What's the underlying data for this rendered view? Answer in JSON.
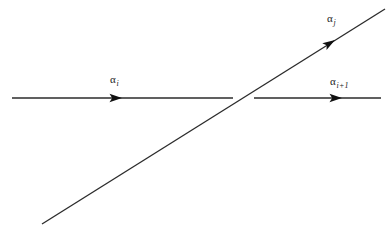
{
  "figure": {
    "type": "diagram",
    "background_color": "#ffffff",
    "stroke_color": "#2b2b2b",
    "text_color": "#1a1a1a",
    "labels": {
      "left_horizontal": {
        "symbol": "α",
        "subscript": "i"
      },
      "diagonal": {
        "symbol": "α",
        "subscript": "j"
      },
      "right_horizontal": {
        "symbol": "α",
        "subscript": "i+1"
      }
    },
    "geometry": {
      "horizontal_left": {
        "x1": 12,
        "y1": 98,
        "x2": 233,
        "y2": 98
      },
      "horizontal_right": {
        "x1": 254,
        "y1": 98,
        "x2": 381,
        "y2": 98
      },
      "diagonal": {
        "x1": 42,
        "y1": 224,
        "x2": 385,
        "y2": 9
      },
      "crossing_point": {
        "x": 243,
        "y": 98
      },
      "arrowheads": [
        {
          "name": "arrowhead-alpha-i",
          "x": 122,
          "y": 98,
          "angle_deg": 0
        },
        {
          "name": "arrowhead-alpha-i-plus-1",
          "x": 342,
          "y": 98,
          "angle_deg": 0
        },
        {
          "name": "arrowhead-alpha-j",
          "x": 335,
          "y": 40,
          "angle_deg": -32
        }
      ]
    }
  }
}
